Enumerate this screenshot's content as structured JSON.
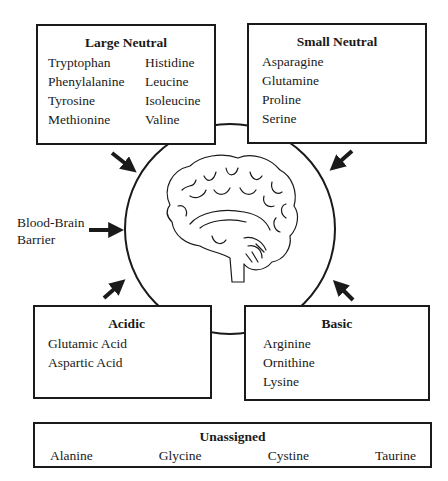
{
  "groups": {
    "large_neutral": {
      "title": "Large Neutral",
      "col1": [
        "Tryptophan",
        "Phenylalanine",
        "Tyrosine",
        "Methionine"
      ],
      "col2": [
        "Histidine",
        "Leucine",
        "Isoleucine",
        "Valine"
      ]
    },
    "small_neutral": {
      "title": "Small Neutral",
      "items": [
        "Asparagine",
        "Glutamine",
        "Proline",
        "Serine"
      ]
    },
    "acidic": {
      "title": "Acidic",
      "items": [
        "Glutamic Acid",
        "Aspartic Acid"
      ]
    },
    "basic": {
      "title": "Basic",
      "items": [
        "Arginine",
        "Ornithine",
        "Lysine"
      ]
    },
    "unassigned": {
      "title": "Unassigned",
      "items": [
        "Alanine",
        "Glycine",
        "Cystine",
        "Taurine"
      ]
    }
  },
  "barrier_label": {
    "line1": "Blood-Brain",
    "line2": "Barrier"
  },
  "center_icon": "brain-icon"
}
